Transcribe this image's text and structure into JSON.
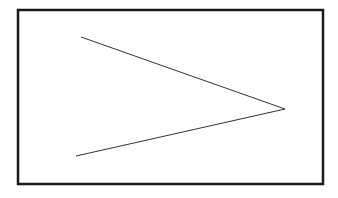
{
  "diagram": {
    "background": "#ffffff",
    "stroke": "#1a1a1a",
    "frame": {
      "x": 18,
      "y": 10,
      "width": 305,
      "height": 174
    },
    "shape": {
      "type": "chevron-right",
      "points": [
        [
          81,
          37
        ],
        [
          285,
          109
        ],
        [
          76,
          156
        ]
      ]
    }
  }
}
